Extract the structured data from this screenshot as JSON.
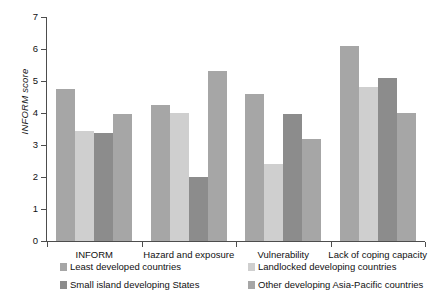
{
  "chart_data": {
    "type": "bar",
    "title": "",
    "subtitle": "",
    "xlabel": "",
    "ylabel": "INFORM score",
    "ylim": [
      0,
      7
    ],
    "yticks": [
      0,
      1,
      2,
      3,
      4,
      5,
      6,
      7
    ],
    "ytick_labels": [
      "0",
      "1",
      "2",
      "3",
      "4",
      "5",
      "6",
      "7"
    ],
    "grid": false,
    "legend_position": "bottom",
    "categories": [
      "INFORM",
      "Hazard and exposure",
      "Vulnerability",
      "Lack of coping capacity"
    ],
    "series": [
      {
        "name": "Least developed countries",
        "color": "#a6a6a6",
        "values": [
          4.75,
          4.25,
          4.6,
          6.1
        ]
      },
      {
        "name": "Landlocked developing countries",
        "color": "#cfcfcf",
        "values": [
          3.44,
          4.0,
          2.4,
          4.8
        ]
      },
      {
        "name": "Small island developing States",
        "color": "#8c8c8c",
        "values": [
          3.38,
          2.0,
          3.97,
          5.1
        ]
      },
      {
        "name": "Other developing Asia-Pacific countries",
        "color": "#a6a6a6",
        "values": [
          3.97,
          5.32,
          3.2,
          4.0
        ]
      }
    ],
    "legend_entries": [
      "Least developed countries",
      "Landlocked developing countries",
      "Small island developing States",
      "Other developing Asia-Pacific countries"
    ]
  },
  "axes": {
    "y_title": "INFORM score"
  }
}
